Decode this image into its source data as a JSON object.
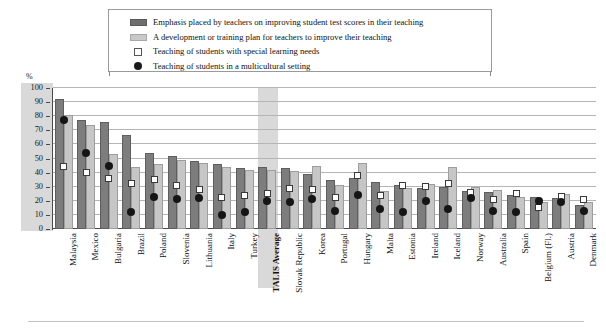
{
  "legend": {
    "items": [
      {
        "icon": "dark-bar-swatch",
        "label": "Emphasis placed by teachers on improving student test scores in their teaching"
      },
      {
        "icon": "light-bar-swatch",
        "label": "A development or training plan for teachers to improve their teaching"
      },
      {
        "icon": "white-square-marker",
        "label": "Teaching of students with special learning needs"
      },
      {
        "icon": "black-dot-marker",
        "label": "Teaching of students in a multicultural setting"
      }
    ]
  },
  "axis": {
    "unit_label": "%",
    "yticks": [
      "100",
      "90",
      "80",
      "70",
      "60",
      "50",
      "40",
      "30",
      "20",
      "10",
      "0"
    ]
  },
  "colors": {
    "dark_bar": "#7d7d7d",
    "light_bar": "#c6c6c6",
    "marker_square": "#ffffff",
    "marker_dot": "#151515",
    "highlight_band": "#d9d9d9",
    "gridline": "#b5b5b5"
  },
  "chart_data": {
    "type": "bar",
    "title": "",
    "xlabel": "",
    "ylabel": "%",
    "ylim": [
      0,
      100
    ],
    "ytick_step": 10,
    "grid": true,
    "legend_position": "top",
    "highlighted_category": "TALIS Average",
    "categories": [
      "Malaysia",
      "Mexico",
      "Bulgaria",
      "Brazil",
      "Poland",
      "Slovenia",
      "Lithuania",
      "Italy",
      "Turkey",
      "TALIS Average",
      "Slovak Republic",
      "Korea",
      "Portugal",
      "Hungary",
      "Malta",
      "Estonia",
      "Ireland",
      "Iceland",
      "Norway",
      "Australia",
      "Spain",
      "Belgium (Fl.)",
      "Austria",
      "Denmark"
    ],
    "series": [
      {
        "name": "Emphasis placed by teachers on improving student test scores in their teaching",
        "type": "bar",
        "color": "#7d7d7d",
        "values": [
          92,
          77,
          76,
          67,
          54,
          52,
          48,
          46,
          43,
          44,
          43,
          39,
          35,
          36,
          33,
          31,
          29,
          30,
          27,
          26,
          24,
          23,
          22,
          17
        ]
      },
      {
        "name": "A development or training plan for teachers to improve their teaching",
        "type": "bar",
        "color": "#c6c6c6",
        "values": [
          81,
          74,
          53,
          44,
          46,
          49,
          47,
          44,
          42,
          42,
          41,
          45,
          31,
          47,
          27,
          29,
          32,
          44,
          30,
          28,
          23,
          19,
          25,
          19
        ]
      },
      {
        "name": "Teaching of students with special learning needs",
        "type": "marker",
        "marker": "white-square",
        "values": [
          44,
          40,
          36,
          32,
          35,
          31,
          28,
          22,
          24,
          25,
          29,
          28,
          22,
          38,
          24,
          31,
          30,
          32,
          26,
          21,
          25,
          15,
          23,
          21
        ]
      },
      {
        "name": "Teaching of students in a multicultural setting",
        "type": "marker",
        "marker": "black-dot",
        "values": [
          77,
          54,
          45,
          12,
          23,
          21,
          22,
          10,
          12,
          20,
          19,
          21,
          13,
          24,
          14,
          12,
          20,
          14,
          22,
          13,
          12,
          20,
          19,
          13
        ]
      }
    ]
  }
}
